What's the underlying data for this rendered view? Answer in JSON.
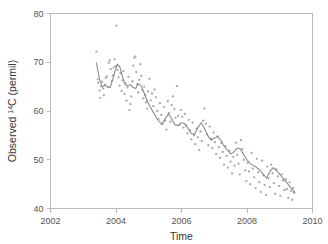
{
  "chart_data": {
    "type": "scatter",
    "title": "",
    "xlabel": "Time",
    "ylabel": "Observed 14C (permil)",
    "ylabel_prefix": "Observed ",
    "ylabel_superscript": "14",
    "ylabel_suffix": "C (permil)",
    "xlim": [
      2002,
      2010
    ],
    "ylim": [
      40,
      80
    ],
    "xticks": [
      2002,
      2004,
      2006,
      2008,
      2010
    ],
    "xticklabels": [
      "2002",
      "2004",
      "2006",
      "2008",
      "2010"
    ],
    "yticks": [
      40,
      50,
      60,
      70,
      80
    ],
    "yticklabels": [
      "40",
      "50",
      "60",
      "70",
      "80"
    ],
    "grid": false,
    "legend": false,
    "point_color": "#a8a8a8",
    "line_color": "#8a8a8a",
    "axis_color": "#b9b9b9",
    "series": [
      {
        "name": "Observed 14C",
        "marker": "dot",
        "x": [
          2003.4,
          2003.44,
          2003.46,
          2003.5,
          2003.52,
          2003.55,
          2003.58,
          2003.61,
          2003.63,
          2003.66,
          2003.69,
          2003.72,
          2003.75,
          2003.78,
          2003.81,
          2003.84,
          2003.87,
          2003.9,
          2003.93,
          2003.96,
          2003.99,
          2004.02,
          2004.05,
          2004.08,
          2004.11,
          2004.14,
          2004.17,
          2004.2,
          2004.23,
          2004.26,
          2004.29,
          2004.32,
          2004.35,
          2004.38,
          2004.41,
          2004.44,
          2004.47,
          2004.5,
          2004.53,
          2004.56,
          2004.59,
          2004.62,
          2004.65,
          2004.68,
          2004.71,
          2004.74,
          2004.77,
          2004.8,
          2004.83,
          2004.86,
          2004.89,
          2004.92,
          2004.95,
          2004.98,
          2005.02,
          2005.06,
          2005.1,
          2005.14,
          2005.18,
          2005.22,
          2005.26,
          2005.3,
          2005.34,
          2005.38,
          2005.42,
          2005.46,
          2005.5,
          2005.54,
          2005.58,
          2005.62,
          2005.66,
          2005.7,
          2005.74,
          2005.78,
          2005.82,
          2005.86,
          2005.9,
          2005.94,
          2005.98,
          2006.02,
          2006.06,
          2006.1,
          2006.14,
          2006.18,
          2006.22,
          2006.26,
          2006.3,
          2006.34,
          2006.38,
          2006.42,
          2006.46,
          2006.5,
          2006.54,
          2006.58,
          2006.62,
          2006.66,
          2006.7,
          2006.74,
          2006.78,
          2006.82,
          2006.86,
          2006.9,
          2006.94,
          2006.98,
          2007.02,
          2007.06,
          2007.1,
          2007.14,
          2007.18,
          2007.22,
          2007.26,
          2007.3,
          2007.34,
          2007.38,
          2007.42,
          2007.46,
          2007.5,
          2007.54,
          2007.58,
          2007.62,
          2007.66,
          2007.7,
          2007.74,
          2007.78,
          2007.82,
          2007.86,
          2007.9,
          2007.94,
          2007.98,
          2008.02,
          2008.06,
          2008.1,
          2008.14,
          2008.18,
          2008.22,
          2008.26,
          2008.3,
          2008.34,
          2008.38,
          2008.42,
          2008.46,
          2008.5,
          2008.54,
          2008.58,
          2008.62,
          2008.66,
          2008.7,
          2008.74,
          2008.78,
          2008.82,
          2008.86,
          2008.9,
          2008.94,
          2008.98,
          2009.02,
          2009.06,
          2009.1,
          2009.14,
          2009.18,
          2009.22,
          2009.26,
          2009.3,
          2009.34,
          2009.38,
          2009.41,
          2009.43,
          2009.45
        ],
        "y": [
          72.2,
          66.5,
          65.8,
          64.2,
          62.7,
          65.1,
          66.0,
          64.6,
          63.2,
          65.4,
          66.8,
          67.1,
          64.9,
          69.9,
          70.4,
          68.6,
          66.2,
          67.3,
          68.9,
          70.6,
          69.2,
          77.5,
          68.4,
          66.9,
          65.2,
          67.8,
          64.1,
          66.3,
          68.2,
          63.5,
          65.7,
          62.1,
          64.8,
          67.0,
          60.2,
          61.4,
          63.0,
          66.1,
          69.3,
          70.9,
          71.2,
          68.0,
          65.5,
          63.8,
          66.4,
          69.6,
          67.2,
          64.3,
          62.6,
          65.0,
          63.3,
          61.8,
          60.5,
          64.0,
          66.6,
          62.2,
          63.6,
          61.0,
          64.4,
          62.8,
          60.0,
          58.4,
          61.6,
          59.2,
          57.4,
          60.8,
          58.0,
          56.2,
          62.0,
          59.6,
          57.8,
          61.2,
          63.0,
          60.4,
          58.6,
          65.1,
          59.0,
          57.2,
          60.2,
          58.8,
          56.6,
          59.4,
          57.0,
          55.4,
          58.2,
          56.0,
          54.2,
          57.6,
          55.0,
          53.2,
          56.4,
          54.6,
          52.0,
          55.8,
          53.8,
          58.0,
          60.5,
          57.4,
          55.2,
          53.0,
          56.8,
          54.4,
          52.4,
          55.6,
          53.6,
          51.2,
          54.8,
          52.6,
          50.4,
          53.4,
          51.6,
          49.0,
          52.8,
          50.8,
          48.4,
          51.8,
          49.6,
          47.2,
          50.6,
          48.8,
          53.5,
          51.0,
          49.2,
          47.0,
          54.0,
          52.2,
          50.0,
          47.8,
          45.6,
          49.4,
          47.6,
          45.0,
          51.4,
          48.2,
          46.4,
          44.2,
          50.2,
          47.4,
          45.4,
          43.4,
          49.8,
          46.8,
          44.8,
          42.8,
          48.6,
          46.2,
          44.4,
          49.0,
          47.2,
          45.2,
          43.0,
          48.0,
          46.6,
          44.6,
          42.6,
          47.0,
          45.8,
          43.8,
          46.0,
          44.0,
          42.2,
          45.4,
          43.6,
          41.8,
          44.2,
          43.4,
          43.2
        ]
      }
    ],
    "trend": {
      "name": "smoothed trend",
      "x": [
        2003.4,
        2003.5,
        2003.58,
        2003.66,
        2003.74,
        2003.82,
        2003.9,
        2003.98,
        2004.04,
        2004.12,
        2004.2,
        2004.28,
        2004.36,
        2004.44,
        2004.52,
        2004.6,
        2004.68,
        2004.76,
        2004.84,
        2004.92,
        2005.0,
        2005.1,
        2005.2,
        2005.3,
        2005.4,
        2005.5,
        2005.6,
        2005.7,
        2005.8,
        2005.9,
        2006.0,
        2006.1,
        2006.2,
        2006.3,
        2006.4,
        2006.5,
        2006.6,
        2006.7,
        2006.8,
        2006.9,
        2007.0,
        2007.1,
        2007.2,
        2007.3,
        2007.4,
        2007.5,
        2007.6,
        2007.7,
        2007.8,
        2007.9,
        2008.0,
        2008.1,
        2008.2,
        2008.3,
        2008.4,
        2008.5,
        2008.6,
        2008.7,
        2008.8,
        2008.9,
        2009.0,
        2009.1,
        2009.2,
        2009.3,
        2009.4,
        2009.45
      ],
      "y": [
        69.9,
        66.5,
        64.9,
        65.3,
        65.0,
        64.8,
        66.4,
        68.4,
        69.6,
        69.0,
        67.0,
        65.4,
        65.2,
        65.4,
        64.8,
        64.6,
        65.6,
        65.2,
        64.0,
        62.6,
        61.4,
        60.2,
        59.0,
        58.0,
        57.2,
        58.4,
        59.4,
        58.4,
        57.2,
        57.0,
        57.6,
        57.4,
        56.4,
        55.4,
        55.2,
        56.6,
        57.6,
        56.4,
        55.0,
        54.0,
        54.4,
        54.8,
        54.0,
        52.8,
        52.0,
        51.2,
        51.6,
        52.4,
        52.2,
        51.0,
        50.0,
        49.2,
        48.8,
        48.4,
        47.8,
        47.0,
        46.2,
        47.6,
        48.4,
        47.8,
        47.0,
        46.2,
        45.4,
        44.6,
        43.8,
        43.4
      ]
    }
  }
}
